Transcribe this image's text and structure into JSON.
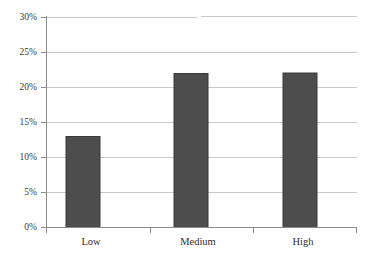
{
  "chart_data": {
    "type": "bar",
    "title": "",
    "subtitle": "",
    "xlabel": "",
    "ylabel": "",
    "categories": [
      "Low",
      "Medium",
      "High"
    ],
    "values": [
      6,
      13,
      22
    ],
    "value_unit": "%",
    "ylim": [
      0,
      30
    ],
    "ytick_values": [
      0,
      5,
      10,
      15,
      20,
      25,
      30
    ],
    "ytick_labels": [
      "0%",
      "5%",
      "10%",
      "15%",
      "20%",
      "25%",
      "30%"
    ],
    "grid": true,
    "grid_axis": "y",
    "legend": false,
    "legend_position": "none",
    "series": [
      {
        "name": "",
        "values": [
          6,
          13,
          22
        ]
      }
    ],
    "colors": {
      "bar_fill": "#4d4d4d",
      "bar_stroke": "#3a3a3a",
      "gridline": "#c9c9c9",
      "axis": "#8a8a8a",
      "background": "#ffffff",
      "tick_text": "#2e2e2e"
    }
  }
}
